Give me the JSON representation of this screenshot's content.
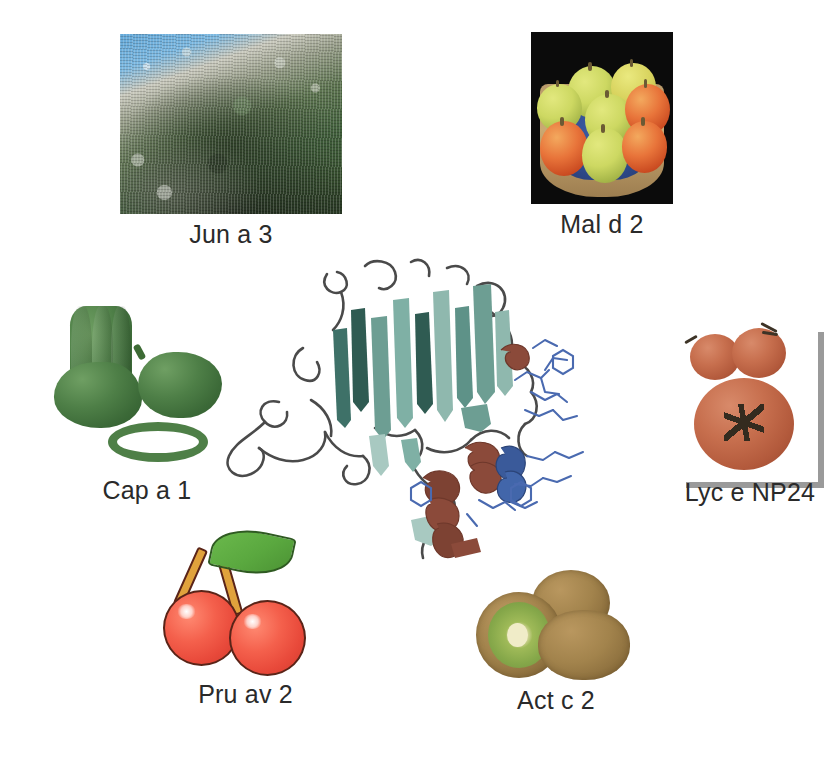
{
  "figure": {
    "background_color": "#ffffff",
    "label_color": "#2a2a2a"
  },
  "center_structure": {
    "name": "protein-ribbon-diagram",
    "description": "Thaumatin-like protein ribbon structure",
    "colors": {
      "beta_sheet_dark": "#3e7168",
      "beta_sheet_mid": "#6d9e93",
      "beta_sheet_light": "#a8c9c1",
      "alpha_helix": "#8b4a3a",
      "coil_blue": "#3a5a9a",
      "loop_gray": "#4a4a4a",
      "sidechain_blue": "#4a6ab0"
    },
    "elements": {
      "beta_strands": 12,
      "alpha_helices": 3,
      "fold": "beta-sandwich"
    }
  },
  "panels": [
    {
      "id": "juniper",
      "label": "Jun a 3",
      "image_name": "juniper-tree-photo",
      "source": "Mountain cedar / juniper shrub on rocky hillside",
      "position": "top-left"
    },
    {
      "id": "apple",
      "label": "Mal d 2",
      "image_name": "apples-basket-photo",
      "source": "Green and red apples in a wicker basket",
      "position": "top-right"
    },
    {
      "id": "pepper",
      "label": "Cap a 1",
      "image_name": "green-bell-peppers-image",
      "source": "Green bell peppers with sliced rings",
      "position": "middle-left"
    },
    {
      "id": "tomato",
      "label": "Lyc e NP24",
      "image_name": "tomatoes-photo",
      "source": "Tomatoes with gray corner frame",
      "position": "middle-right"
    },
    {
      "id": "cherry",
      "label": "Pru av 2",
      "image_name": "cherries-illustration",
      "source": "Pair of red cherries with green leaf",
      "position": "bottom-left"
    },
    {
      "id": "kiwi",
      "label": "Act c 2",
      "image_name": "kiwifruit-photo",
      "source": "Three kiwifruits, one halved",
      "position": "bottom-center"
    }
  ]
}
